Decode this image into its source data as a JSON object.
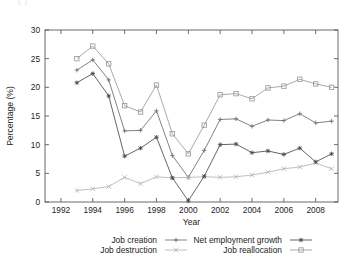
{
  "figure": {
    "cut_off_top_text": "( )",
    "background": "#ffffff"
  },
  "chart_data": {
    "type": "line",
    "title": "",
    "xlabel": "Year",
    "ylabel": "Percentage (%)",
    "xlim": [
      1991,
      2009.4
    ],
    "ylim": [
      0,
      30
    ],
    "xticks": [
      1992,
      1994,
      1996,
      1998,
      2000,
      2002,
      2004,
      2006,
      2008
    ],
    "yticks": [
      0,
      5,
      10,
      15,
      20,
      25,
      30
    ],
    "grid": false,
    "legend_position": "below",
    "legend_columns": 2,
    "x": [
      1993,
      1994,
      1995,
      1996,
      1997,
      1998,
      1999,
      2000,
      2001,
      2002,
      2003,
      2004,
      2005,
      2006,
      2007,
      2008,
      2009
    ],
    "series": [
      {
        "name": "Job creation",
        "marker": "plus",
        "color": "#6d6d6d",
        "values": [
          23.0,
          24.8,
          21.3,
          12.4,
          12.5,
          15.9,
          8.1,
          4.3,
          9.0,
          14.4,
          14.5,
          13.2,
          14.3,
          14.2,
          15.4,
          13.8,
          14.1
        ]
      },
      {
        "name": "Job destruction",
        "marker": "cross",
        "color": "#b4b4b4",
        "values": [
          2.0,
          2.3,
          2.7,
          4.3,
          3.2,
          4.4,
          4.2,
          4.3,
          4.4,
          4.3,
          4.4,
          4.7,
          5.2,
          5.8,
          6.1,
          6.8,
          5.8
        ]
      },
      {
        "name": "Net employment growth",
        "marker": "star",
        "color": "#4a4a4a",
        "values": [
          20.8,
          22.4,
          18.5,
          8.0,
          9.4,
          11.3,
          4.2,
          0.2,
          4.5,
          10.0,
          10.1,
          8.6,
          8.9,
          8.3,
          9.4,
          7.0,
          8.4
        ]
      },
      {
        "name": "Job reallocation",
        "marker": "square",
        "color": "#9a9a9a",
        "values": [
          25.0,
          27.2,
          24.1,
          16.8,
          15.7,
          20.4,
          11.9,
          8.4,
          13.4,
          18.7,
          18.9,
          18.0,
          19.9,
          20.2,
          21.4,
          20.6,
          20.0
        ]
      }
    ]
  }
}
